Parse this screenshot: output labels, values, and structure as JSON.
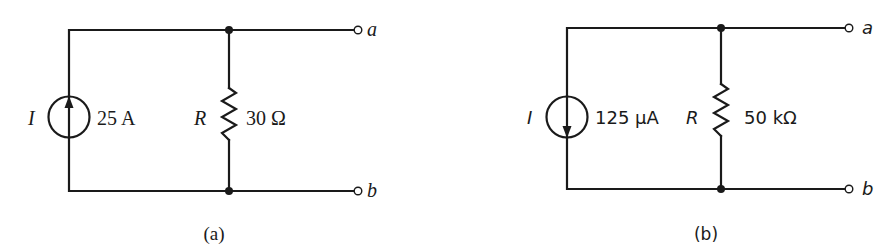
{
  "figure": {
    "panels": [
      {
        "id": "a",
        "caption": "(a)",
        "source": {
          "symbol": "I",
          "value": "25 A",
          "arrow_direction": "up",
          "icon": "current-source-icon"
        },
        "resistor": {
          "symbol": "R",
          "value": "30 Ω",
          "icon": "resistor-icon"
        },
        "terminals": {
          "top": "a",
          "bottom": "b"
        }
      },
      {
        "id": "b",
        "caption": "(b)",
        "source": {
          "symbol": "I",
          "value": "125 μA",
          "arrow_direction": "down",
          "icon": "current-source-icon"
        },
        "resistor": {
          "symbol": "R",
          "value": "50 kΩ",
          "icon": "resistor-icon"
        },
        "terminals": {
          "top": "a",
          "bottom": "b"
        }
      }
    ],
    "colors": {
      "ink": "#1a1a1a",
      "background": "#ffffff"
    }
  }
}
